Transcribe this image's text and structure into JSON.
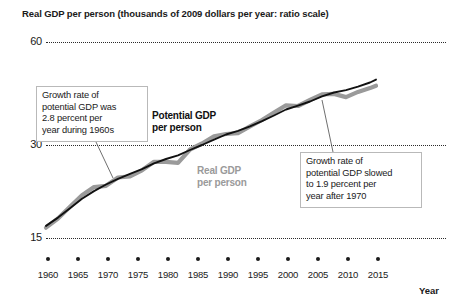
{
  "chart_data": {
    "type": "line",
    "title": "Real GDP per person (thousands of 2009 dollars per year: ratio scale)",
    "xlabel": "Year",
    "ylabel": "",
    "scale": "ratio (logarithmic)",
    "grid": "horizontal dotted gridlines at 15, 30, 60",
    "legend": "inline labels on curves",
    "xlim": [
      1960,
      2015
    ],
    "ylim": [
      15,
      60
    ],
    "yticks": [
      "60",
      "30",
      "15"
    ],
    "ytick_values": [
      60,
      30,
      15
    ],
    "xticks": [
      "1960",
      "1965",
      "1970",
      "1975",
      "1980",
      "1985",
      "1990",
      "1995",
      "2000",
      "2005",
      "2010",
      "2015"
    ],
    "x": [
      1960,
      1962,
      1964,
      1966,
      1968,
      1970,
      1972,
      1974,
      1976,
      1978,
      1980,
      1982,
      1984,
      1986,
      1988,
      1990,
      1992,
      1994,
      1996,
      1998,
      2000,
      2002,
      2004,
      2006,
      2008,
      2010,
      2012,
      2014,
      2015
    ],
    "series": [
      {
        "name": "Potential GDP per person",
        "color": "#111111",
        "values": [
          17.4,
          18.4,
          19.6,
          20.9,
          22.0,
          23.0,
          23.9,
          24.7,
          25.5,
          26.5,
          27.3,
          28.0,
          29.0,
          30.0,
          31.1,
          32.2,
          33.0,
          34.0,
          35.2,
          36.6,
          38.1,
          39.1,
          40.2,
          41.6,
          42.7,
          43.4,
          44.4,
          45.7,
          46.6
        ]
      },
      {
        "name": "Real GDP per person",
        "color": "#9a9a9a",
        "values": [
          17.2,
          18.3,
          19.8,
          21.4,
          22.6,
          22.8,
          24.1,
          24.3,
          25.3,
          26.8,
          26.8,
          26.6,
          29.1,
          30.3,
          31.8,
          32.3,
          32.5,
          34.0,
          35.5,
          37.3,
          39.2,
          39.0,
          40.6,
          42.2,
          42.3,
          41.4,
          42.9,
          44.0,
          44.7
        ]
      }
    ],
    "annotations": [
      {
        "id": "growth-1960s",
        "text": "Growth rate of potential GDP was 2.8 percent per year during 1960s",
        "lines": [
          "Growth rate of",
          "potential GDP was",
          "2.8 percent per",
          "year during 1960s"
        ],
        "points_to_year": 1970,
        "growth_rate_percent": 2.8
      },
      {
        "id": "growth-after-1970",
        "text": "Growth rate of potential GDP slowed to 1.9 percent per year after 1970",
        "lines": [
          "Growth rate of",
          "potential GDP slowed",
          "to 1.9 percent per",
          "year after 1970"
        ],
        "points_to_year": 2007,
        "growth_rate_percent": 1.9
      }
    ],
    "series_labels": [
      {
        "id": "potential",
        "lines": [
          "Potential GDP",
          "per person"
        ],
        "color": "#111111"
      },
      {
        "id": "real",
        "lines": [
          "Real GDP",
          "per person"
        ],
        "color": "#9a9a9a"
      }
    ]
  },
  "figure": {
    "title": "Real GDP per person (thousands of 2009 dollars per year: ratio scale)",
    "x_axis_title": "Year",
    "y_labels": {
      "top": "60",
      "mid": "30",
      "bottom": "15"
    },
    "x_labels": {
      "t0": "1960",
      "t1": "1965",
      "t2": "1970",
      "t3": "1975",
      "t4": "1980",
      "t5": "1985",
      "t6": "1990",
      "t7": "1995",
      "t8": "2000",
      "t9": "2005",
      "t10": "2010",
      "t11": "2015"
    },
    "annotation_left": {
      "l1": "Growth rate of",
      "l2": "potential GDP was",
      "l3": "2.8 percent per",
      "l4": "year during 1960s"
    },
    "annotation_right": {
      "l1": "Growth rate of",
      "l2": "potential GDP slowed",
      "l3": "to 1.9 percent per",
      "l4": "year after 1970"
    },
    "label_potential": {
      "l1": "Potential GDP",
      "l2": "per person"
    },
    "label_real": {
      "l1": "Real GDP",
      "l2": "per person"
    },
    "colors": {
      "potential_line": "#111111",
      "real_line": "#9a9a9a",
      "text": "#1a1a1a",
      "grid": "#2b2b2b",
      "box_border": "#b9b9b9",
      "background": "#ffffff"
    }
  }
}
